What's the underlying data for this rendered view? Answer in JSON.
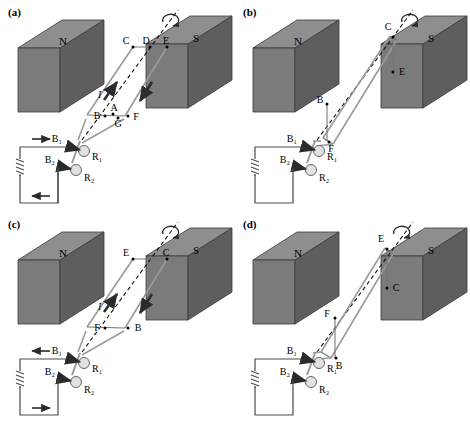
{
  "figure": {
    "type": "diagram",
    "panels": [
      {
        "key": "a",
        "label": "(a)",
        "magnets": {
          "left": "N",
          "right": "S"
        },
        "current_symbol": "I",
        "loop_points": [
          "C",
          "D",
          "E",
          "B",
          "A",
          "G",
          "F"
        ],
        "top_points": [
          "C",
          "D",
          "E"
        ],
        "bottom_points": [
          "B",
          "A",
          "G",
          "F"
        ],
        "brushes": [
          "B₁",
          "B₂"
        ],
        "rings": [
          "R₁",
          "R₂"
        ],
        "circuit_arrows": {
          "top": "right",
          "bottom": "left"
        },
        "loop_arrows": {
          "left_side": "up",
          "right_side": "down"
        },
        "rotation_arrow": true
      },
      {
        "key": "b",
        "label": "(b)",
        "magnets": {
          "left": "N",
          "right": "S"
        },
        "current_symbol": "",
        "loop_points": [
          "C",
          "E",
          "B",
          "F"
        ],
        "top_points": [
          "C",
          "E"
        ],
        "bottom_points": [
          "B",
          "F"
        ],
        "brushes": [
          "B₁",
          "B₂"
        ],
        "rings": [
          "R₁",
          "R₂"
        ],
        "circuit_arrows": {
          "top": "none",
          "bottom": "none"
        },
        "loop_arrows": {
          "left_side": "none",
          "right_side": "none"
        },
        "rotation_arrow": true
      },
      {
        "key": "c",
        "label": "(c)",
        "magnets": {
          "left": "N",
          "right": "S"
        },
        "current_symbol": "I",
        "loop_points": [
          "E",
          "C",
          "F",
          "B"
        ],
        "top_points": [
          "E",
          "C"
        ],
        "bottom_points": [
          "F",
          "B"
        ],
        "brushes": [
          "B₁",
          "B₂"
        ],
        "rings": [
          "R₁",
          "R₂"
        ],
        "circuit_arrows": {
          "top": "left",
          "bottom": "right"
        },
        "loop_arrows": {
          "left_side": "up",
          "right_side": "down"
        },
        "rotation_arrow": true
      },
      {
        "key": "d",
        "label": "(d)",
        "magnets": {
          "left": "N",
          "right": "S"
        },
        "current_symbol": "",
        "loop_points": [
          "E",
          "C",
          "F",
          "B"
        ],
        "top_points": [
          "E",
          "C"
        ],
        "bottom_points": [
          "F",
          "B"
        ],
        "brushes": [
          "B₁",
          "B₂"
        ],
        "rings": [
          "R₁",
          "R₂"
        ],
        "circuit_arrows": {
          "top": "none",
          "bottom": "none"
        },
        "loop_arrows": {
          "left_side": "none",
          "right_side": "none"
        },
        "rotation_arrow": true
      }
    ],
    "labels": {
      "north_pole": "N",
      "south_pole": "S",
      "current": "I",
      "brush1": "B₁",
      "brush2": "B₂",
      "ring1": "R₁",
      "ring2": "R₂",
      "point_A": "A",
      "point_B": "B",
      "point_C": "C",
      "point_D": "D",
      "point_E": "E",
      "point_F": "F",
      "point_G": "G"
    },
    "colors": {
      "magnet_top": "#8e8e8e",
      "magnet_front": "#7b7b7b",
      "magnet_side": "#5e5e5e",
      "magnet_outline": "#3a3a3a",
      "wire": "#9a9a9a",
      "wire_dark": "#555555",
      "dashed_axis": "#111111",
      "circuit": "#4a4a4a",
      "arrow": "#2b2b2b",
      "background": "#ffffff"
    }
  }
}
